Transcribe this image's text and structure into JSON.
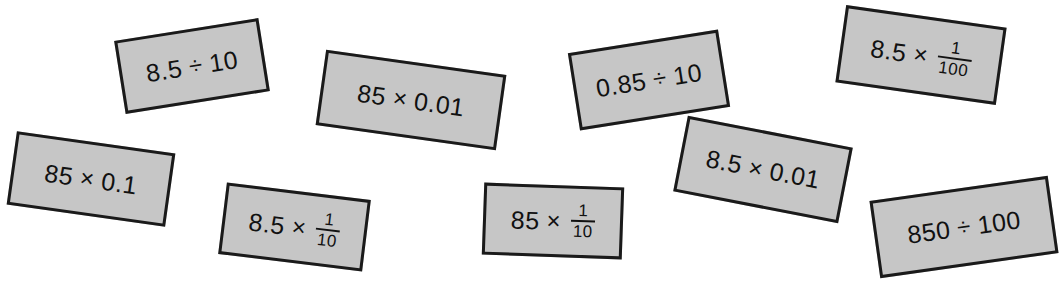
{
  "page": {
    "background_color": "#ffffff",
    "card_fill_color": "#c6c6c6",
    "card_border_color": "#1a1a1a",
    "text_color": "#111111",
    "width": 1061,
    "height": 289
  },
  "cards": [
    {
      "id": "card-1",
      "name": "expression-card-8-5-divide-10",
      "text": "8.5 ÷ 10",
      "left_operand": "8.5",
      "operator": "÷",
      "right_operand": "10",
      "has_fraction": false,
      "x": 119,
      "y": 29,
      "width": 146,
      "height": 74,
      "rotation": -9
    },
    {
      "id": "card-2",
      "name": "expression-card-85-times-0-01",
      "text": "85 × 0.01",
      "left_operand": "85",
      "operator": "×",
      "right_operand": "0.01",
      "has_fraction": false,
      "x": 320,
      "y": 62,
      "width": 182,
      "height": 76,
      "rotation": 8
    },
    {
      "id": "card-3",
      "name": "expression-card-0-85-divide-10",
      "text": "0.85 ÷ 10",
      "left_operand": "0.85",
      "operator": "÷",
      "right_operand": "10",
      "has_fraction": false,
      "x": 573,
      "y": 41,
      "width": 152,
      "height": 78,
      "rotation": -9
    },
    {
      "id": "card-4",
      "name": "expression-card-8-5-times-one-hundredth",
      "text": "8.5 × 1/100",
      "left_operand": "8.5",
      "operator": "×",
      "has_fraction": true,
      "numerator": "1",
      "denominator": "100",
      "x": 840,
      "y": 16,
      "width": 162,
      "height": 78,
      "rotation": 8
    },
    {
      "id": "card-5",
      "name": "expression-card-85-times-0-1",
      "text": "85 × 0.1",
      "left_operand": "85",
      "operator": "×",
      "right_operand": "0.1",
      "has_fraction": false,
      "x": 11,
      "y": 142,
      "width": 160,
      "height": 74,
      "rotation": 8
    },
    {
      "id": "card-6",
      "name": "expression-card-8-5-times-one-tenth",
      "text": "8.5 × 1/10",
      "left_operand": "8.5",
      "operator": "×",
      "has_fraction": true,
      "numerator": "1",
      "denominator": "10",
      "x": 222,
      "y": 191,
      "width": 145,
      "height": 72,
      "rotation": 7
    },
    {
      "id": "card-7",
      "name": "expression-card-85-times-one-tenth",
      "text": "85 × 1/10",
      "left_operand": "85",
      "operator": "×",
      "has_fraction": true,
      "numerator": "1",
      "denominator": "10",
      "x": 483,
      "y": 185,
      "width": 140,
      "height": 72,
      "rotation": 2
    },
    {
      "id": "card-8",
      "name": "expression-card-8-5-times-0-01",
      "text": "8.5 × 0.01",
      "left_operand": "8.5",
      "operator": "×",
      "right_operand": "0.01",
      "has_fraction": false,
      "x": 679,
      "y": 131,
      "width": 168,
      "height": 77,
      "rotation": 11
    },
    {
      "id": "card-9",
      "name": "expression-card-850-divide-100",
      "text": "850 ÷ 100",
      "left_operand": "850",
      "operator": "÷",
      "right_operand": "100",
      "has_fraction": false,
      "x": 874,
      "y": 188,
      "width": 180,
      "height": 78,
      "rotation": -8
    }
  ]
}
